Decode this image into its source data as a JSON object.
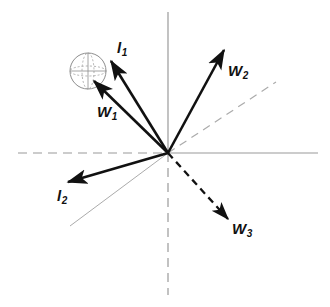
{
  "figure": {
    "width": 330,
    "height": 307,
    "background_color": "#ffffff",
    "origin": {
      "x": 168,
      "y": 153
    },
    "colors": {
      "vector_stroke": "#111111",
      "axis_gray": "#9a9a9a",
      "guide_gray": "#a8a8a8",
      "sphere_stroke": "#8d8d8d",
      "label_text": "#111111"
    }
  },
  "axes": {
    "horizontal_left": {
      "style": "dashed",
      "from": {
        "x": 18,
        "y": 153
      },
      "to": {
        "x": 168,
        "y": 153
      }
    },
    "horizontal_right": {
      "style": "solid",
      "from": {
        "x": 168,
        "y": 153
      },
      "to": {
        "x": 318,
        "y": 153
      }
    },
    "vertical_up": {
      "style": "solid",
      "from": {
        "x": 168,
        "y": 12
      },
      "to": {
        "x": 168,
        "y": 153
      }
    },
    "vertical_down": {
      "style": "dashed",
      "from": {
        "x": 168,
        "y": 153
      },
      "to": {
        "x": 168,
        "y": 295
      }
    }
  },
  "guides": [
    {
      "name": "guide-line-lower-left",
      "style": "solid",
      "from": {
        "x": 168,
        "y": 153
      },
      "to": {
        "x": 70,
        "y": 226
      }
    },
    {
      "name": "guide-line-upper-right",
      "style": "dashed",
      "from": {
        "x": 168,
        "y": 153
      },
      "to": {
        "x": 276,
        "y": 82
      }
    }
  ],
  "sphere": {
    "name": "unit-sphere",
    "center": {
      "x": 88,
      "y": 71
    },
    "radius": 18,
    "equator_ry": 5,
    "meridian_rx": 6,
    "stroke": "#8d8d8d"
  },
  "vectors": [
    {
      "id": "l1",
      "label": "l",
      "subscript": "1",
      "style": "solid",
      "from": {
        "x": 168,
        "y": 153
      },
      "to": {
        "x": 111,
        "y": 61
      },
      "label_pos": {
        "x": 117,
        "y": 40
      }
    },
    {
      "id": "w1",
      "label": "W",
      "subscript": "1",
      "style": "solid",
      "from": {
        "x": 168,
        "y": 153
      },
      "to": {
        "x": 94,
        "y": 81
      },
      "label_pos": {
        "x": 97,
        "y": 104
      }
    },
    {
      "id": "w2",
      "label": "W",
      "subscript": "2",
      "style": "solid",
      "from": {
        "x": 168,
        "y": 153
      },
      "to": {
        "x": 224,
        "y": 50
      },
      "label_pos": {
        "x": 228,
        "y": 63
      }
    },
    {
      "id": "l2",
      "label": "l",
      "subscript": "2",
      "style": "solid",
      "from": {
        "x": 168,
        "y": 153
      },
      "to": {
        "x": 68,
        "y": 182
      },
      "label_pos": {
        "x": 57,
        "y": 188
      }
    },
    {
      "id": "w3",
      "label": "W",
      "subscript": "3",
      "style": "dashed",
      "from": {
        "x": 168,
        "y": 153
      },
      "to": {
        "x": 228,
        "y": 219
      },
      "label_pos": {
        "x": 232,
        "y": 221
      }
    }
  ]
}
